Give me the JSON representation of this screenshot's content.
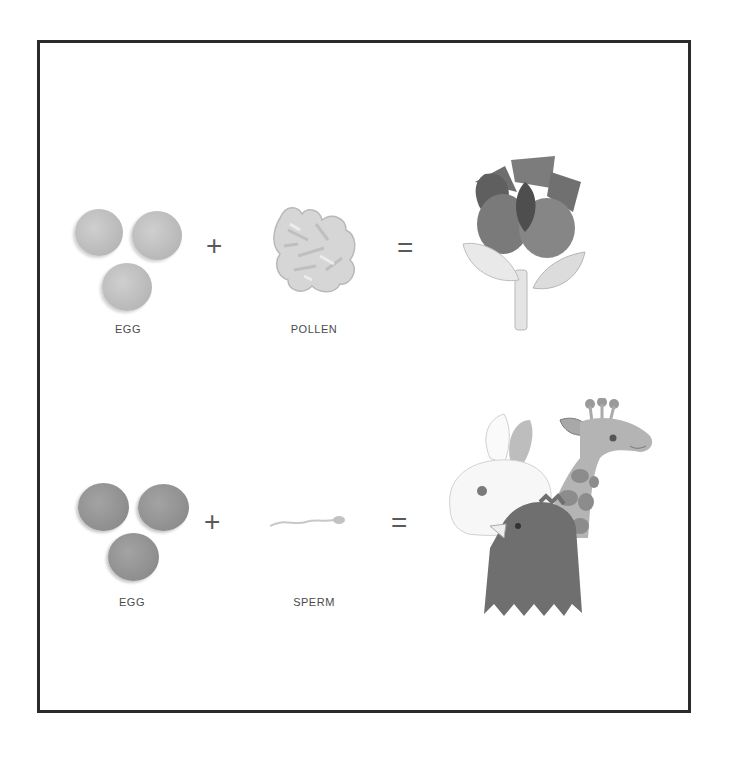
{
  "figure": {
    "rows": [
      {
        "name": "plant",
        "item1": {
          "label": "EGG",
          "icon": "egg-cells-icon",
          "color": "#bdbdbd"
        },
        "operator1": "+",
        "item2": {
          "label": "POLLEN",
          "icon": "pollen-icon",
          "color": "#d2d2d2"
        },
        "operator2": "=",
        "result": {
          "icon": "flower-icon"
        }
      },
      {
        "name": "animal",
        "item1": {
          "label": "EGG",
          "icon": "egg-cells-icon",
          "color": "#939393"
        },
        "operator1": "+",
        "item2": {
          "label": "SPERM",
          "icon": "sperm-icon",
          "color": "#c8c8c8"
        },
        "operator2": "=",
        "result": {
          "icon": "animals-icon"
        }
      }
    ],
    "frame_color": "#2b2b2b"
  }
}
